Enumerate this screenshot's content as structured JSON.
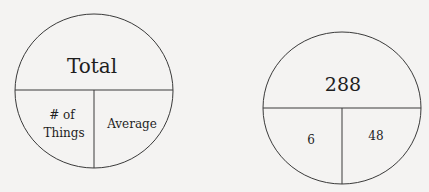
{
  "diagrams": [
    {
      "name": "template-circle",
      "top_label": "Total",
      "bottom_left_label_line1": "# of",
      "bottom_left_label_line2": "Things",
      "bottom_right_label": "Average"
    },
    {
      "name": "example-circle",
      "top_label": "288",
      "bottom_left_label": "6",
      "bottom_right_label": "48"
    }
  ],
  "colors": {
    "background": "#f4f3f2",
    "stroke": "#3a3a3a",
    "text": "#1e1e1e"
  }
}
